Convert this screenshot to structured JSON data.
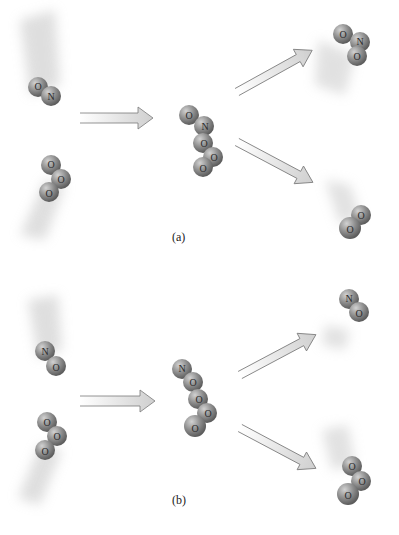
{
  "figure": {
    "panels": [
      {
        "caption": "(a)",
        "reactants": [
          {
            "molecule": "NO",
            "atoms": [
              "O",
              "N"
            ]
          },
          {
            "molecule": "O3",
            "atoms": [
              "O",
              "O",
              "O"
            ]
          }
        ],
        "complex": {
          "atoms": [
            "O",
            "N",
            "O",
            "O",
            "O"
          ]
        },
        "products": [
          {
            "molecule": "NO2",
            "atoms": [
              "O",
              "N",
              "O"
            ]
          },
          {
            "molecule": "O2",
            "atoms": [
              "O",
              "O"
            ]
          }
        ]
      },
      {
        "caption": "(b)",
        "reactants": [
          {
            "molecule": "NO",
            "atoms": [
              "N",
              "O"
            ]
          },
          {
            "molecule": "O3",
            "atoms": [
              "O",
              "O",
              "O"
            ]
          }
        ],
        "complex": {
          "atoms": [
            "N",
            "O",
            "O",
            "O",
            "O"
          ]
        },
        "products": [
          {
            "molecule": "NO",
            "atoms": [
              "N",
              "O"
            ]
          },
          {
            "molecule": "O3",
            "atoms": [
              "O",
              "O",
              "O"
            ]
          }
        ]
      }
    ],
    "colors": {
      "atom_fill": "#8c8c8c",
      "atom_highlight": "#c8c8c8",
      "arrow_fill": "#d8d8d8",
      "arrow_stroke": "#7a7a7a",
      "motion_blur": "#b0b0b0"
    }
  }
}
